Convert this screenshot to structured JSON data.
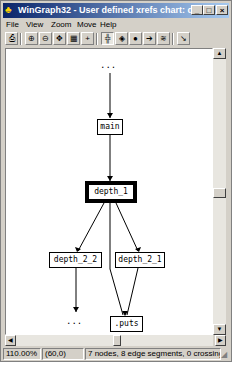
{
  "window": {
    "title": "WinGraph32 - User defined xrefs chart: depth_1",
    "buttons": {
      "minimize": "_",
      "maximize": "□",
      "close": "×"
    }
  },
  "menu": [
    "File",
    "View",
    "Zoom",
    "Move",
    "Help"
  ],
  "toolbar": {
    "icons": [
      "print-icon",
      "zoom-in-icon",
      "zoom-out-icon",
      "fit-icon",
      "zoom-100-icon",
      "move-icon",
      "layout-icon",
      "color-icon",
      "node-info-icon",
      "arrow-icon",
      "stack-icon",
      "cursor-icon"
    ]
  },
  "graph": {
    "nodes": [
      {
        "id": "top_dots",
        "label": "..."
      },
      {
        "id": "main",
        "label": "main"
      },
      {
        "id": "depth_1",
        "label": "depth_1",
        "selected": true
      },
      {
        "id": "depth_2_2",
        "label": "depth_2_2"
      },
      {
        "id": "depth_2_1",
        "label": "depth_2_1"
      },
      {
        "id": "bottom_dots",
        "label": "..."
      },
      {
        "id": "puts",
        "label": ".puts"
      }
    ],
    "edges": [
      [
        "top_dots",
        "main"
      ],
      [
        "main",
        "depth_1"
      ],
      [
        "depth_1",
        "depth_2_2"
      ],
      [
        "depth_1",
        "depth_2_1"
      ],
      [
        "depth_1",
        "puts"
      ],
      [
        "depth_2_2",
        "bottom_dots"
      ],
      [
        "depth_2_1",
        "puts"
      ]
    ]
  },
  "status": {
    "zoom": "110.00%",
    "coords": "(60,0)",
    "info": "7 nodes, 8 edge segments, 0 crossings"
  }
}
